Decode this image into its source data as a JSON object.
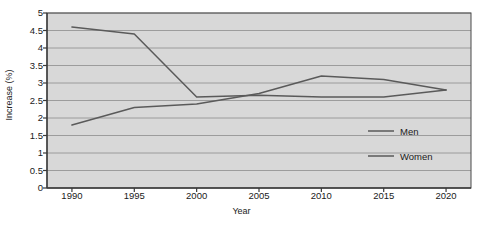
{
  "chart_data": {
    "type": "line",
    "title": "",
    "xlabel": "Year",
    "ylabel": "Increase (%)",
    "categories": [
      1990,
      1995,
      2000,
      2005,
      2010,
      2015,
      2020
    ],
    "x": [
      1990,
      1995,
      2000,
      2005,
      2010,
      2015,
      2020
    ],
    "xlim": [
      1988,
      2022
    ],
    "ylim": [
      0,
      5
    ],
    "ytick_labels": [
      "0",
      "0.5",
      "1",
      "1.5",
      "2",
      "2.5",
      "3",
      "3.5",
      "4",
      "4.5",
      "5"
    ],
    "ytick_values": [
      0,
      0.5,
      1,
      1.5,
      2,
      2.5,
      3,
      3.5,
      4,
      4.5,
      5
    ],
    "xtick_labels": [
      "1990",
      "1995",
      "2000",
      "2005",
      "2010",
      "2015",
      "2020"
    ],
    "grid": "horizontal",
    "legend_position": "inside-lower-right",
    "plot_background": "#d8d8d8",
    "gridline_color": "#8d8d8d",
    "axis_color": "#4a4a4a",
    "series": [
      {
        "name": "Men",
        "color": "#5a5a5a",
        "values": [
          4.6,
          4.4,
          2.6,
          2.65,
          2.6,
          2.6,
          2.8
        ]
      },
      {
        "name": "Women",
        "color": "#5a5a5a",
        "values": [
          1.8,
          2.3,
          2.4,
          2.7,
          3.2,
          3.1,
          2.8
        ]
      }
    ]
  },
  "legend": {
    "items": [
      {
        "label": "Men"
      },
      {
        "label": "Women"
      }
    ]
  }
}
